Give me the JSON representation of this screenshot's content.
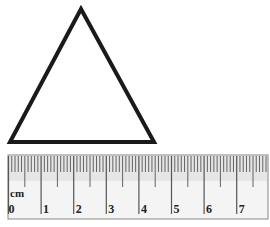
{
  "diagram": {
    "triangle": {
      "apex": [
        81,
        9
      ],
      "base_left": [
        10,
        142
      ],
      "base_right": [
        154,
        142
      ],
      "stroke": "#1a1a1a",
      "stroke_width": 4
    },
    "ruler": {
      "x": 8,
      "y": 155,
      "width": 260,
      "height": 64,
      "unit_label": "cm",
      "px_per_cm": 32.6,
      "origin_x": 8.5,
      "labels": [
        "0",
        "1",
        "2",
        "3",
        "4",
        "5",
        "6",
        "7"
      ],
      "tick_color": "#555555",
      "background": "#f4f4f4",
      "border": "#888888"
    }
  }
}
